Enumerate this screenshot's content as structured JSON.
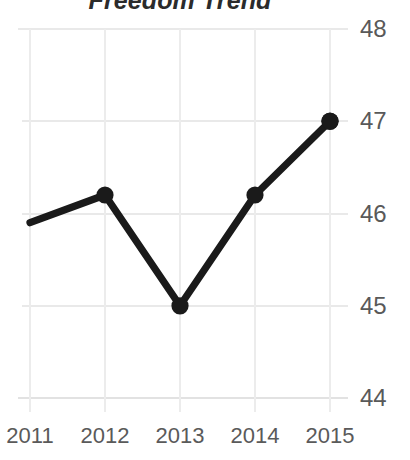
{
  "chart_data": {
    "type": "line",
    "title": "Freedom Trend",
    "xlabel": "",
    "ylabel": "",
    "categories": [
      "2011",
      "2012",
      "2013",
      "2014",
      "2015"
    ],
    "x": [
      2011,
      2012,
      2013,
      2014,
      2015
    ],
    "values": [
      45.9,
      46.2,
      45.0,
      46.2,
      47.0
    ],
    "series": [
      {
        "name": "Freedom Trend",
        "values": [
          45.9,
          46.2,
          45.0,
          46.2,
          47.0
        ]
      }
    ],
    "ylim": [
      44,
      48
    ],
    "xlim": [
      2011,
      2015
    ],
    "yticks": [
      44,
      45,
      46,
      47,
      48
    ],
    "ytick_labels": [
      "44",
      "45",
      "46",
      "47",
      "48"
    ],
    "xticks": [
      2011,
      2012,
      2013,
      2014,
      2015
    ],
    "xtick_labels": [
      "2011",
      "2012",
      "2013",
      "2014",
      "2015"
    ],
    "grid": true,
    "grid_axis": "both",
    "legend": false,
    "legend_position": "none",
    "y_axis_side": "right",
    "line_color": "#1a1a1a",
    "marker": "circle",
    "marker_color": "#1a1a1a",
    "grid_color": "#e9e9e9",
    "title_color": "#2b2b2b",
    "tick_label_color": "#595959",
    "background_color": "#ffffff"
  }
}
